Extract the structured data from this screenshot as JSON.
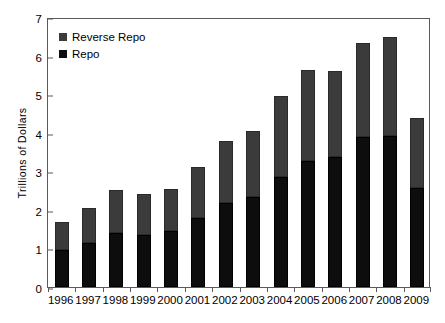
{
  "chart_data": {
    "type": "bar",
    "title": "",
    "subtitle": "",
    "xlabel": "",
    "ylabel": "Trillions of Dollars",
    "categories": [
      "1996",
      "1997",
      "1998",
      "1999",
      "2000",
      "2001",
      "2002",
      "2003",
      "2004",
      "2005",
      "2006",
      "2007",
      "2008",
      "2009"
    ],
    "series": [
      {
        "name": "Repo",
        "color": "#0d0d0d",
        "values": [
          0.97,
          1.15,
          1.41,
          1.35,
          1.44,
          1.78,
          2.17,
          2.34,
          2.86,
          3.28,
          3.38,
          3.88,
          3.92,
          2.57
        ]
      },
      {
        "name": "Reverse Repo",
        "color": "#3b3b3b",
        "values": [
          0.71,
          0.89,
          1.11,
          1.07,
          1.09,
          1.32,
          1.62,
          1.71,
          2.08,
          2.35,
          2.22,
          2.45,
          2.57,
          1.82
        ]
      }
    ],
    "totals": [
      1.68,
      2.04,
      2.52,
      2.42,
      2.53,
      3.1,
      3.79,
      4.05,
      4.94,
      5.63,
      5.6,
      6.33,
      6.49,
      4.39
    ],
    "stacked": true,
    "stack_order": [
      "Repo",
      "Reverse Repo"
    ],
    "ylim": [
      0,
      7
    ],
    "yticks": [
      0,
      1,
      2,
      3,
      4,
      5,
      6,
      7
    ],
    "ytick_labels": [
      "0",
      "1",
      "2",
      "3",
      "4",
      "5",
      "6",
      "7"
    ],
    "grid": false,
    "legend_position": "top-left",
    "legend_entries": [
      "Reverse Repo",
      "Repo"
    ]
  },
  "legend": {
    "items": [
      {
        "label": "Reverse Repo",
        "color": "#3b3b3b"
      },
      {
        "label": "Repo",
        "color": "#0d0d0d"
      }
    ]
  },
  "axes": {
    "y_title": "Trillions of Dollars"
  }
}
